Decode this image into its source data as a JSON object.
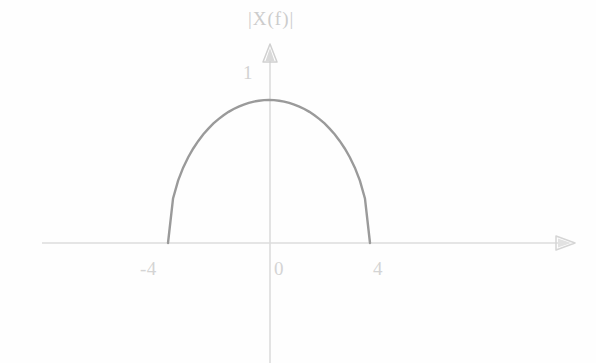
{
  "figure": {
    "background_color": "#fefefe",
    "width": 596,
    "height": 363
  },
  "axes": {
    "color": "#d8d8d8",
    "x_axis": {
      "name": "horizontal-frequency-axis",
      "y_pixel": 243,
      "x_start_pixel": 42,
      "x_end_pixel": 575,
      "arrow": "right"
    },
    "y_axis": {
      "name": "vertical-magnitude-axis",
      "x_pixel": 270,
      "y_top_pixel": 48,
      "y_bottom_pixel": 363,
      "arrow": "up"
    }
  },
  "labels": {
    "y_axis_title": "|X(f)|",
    "y_tick_1": "1",
    "x_tick_neg4": "-4",
    "x_tick_0": "0",
    "x_tick_4": "4"
  },
  "curve": {
    "name": "semi-ellipse-spectrum-curve",
    "color": "#9a9a9a",
    "stroke_width": 2.4,
    "shape": "semi-ellipse",
    "left_endpoint_px": [
      168,
      243
    ],
    "right_endpoint_px": [
      370,
      243
    ],
    "apex_px": [
      270,
      100
    ]
  },
  "chart_data": {
    "type": "line",
    "title": "",
    "subtitle": "",
    "xlabel": "f",
    "ylabel": "|X(f)|",
    "xlim": [
      -6.5,
      12.2
    ],
    "ylim": [
      0,
      1.35
    ],
    "grid": false,
    "legend": null,
    "axis_tick_labels": {
      "x": [
        "-4",
        "0",
        "4"
      ],
      "y": [
        "1"
      ]
    },
    "x_tick_values": [
      -4,
      0,
      4
    ],
    "y_tick_values": [
      1
    ],
    "annotations": [
      {
        "text": "|X(f)|",
        "position": "above y-axis arrow",
        "x": 0,
        "y": 1.33
      },
      {
        "text": "1",
        "position": "left of y-axis",
        "x": -0.9,
        "y": 1.15
      }
    ],
    "series": [
      {
        "name": "|X(f)|",
        "color": "#9a9a9a",
        "x": [
          -4,
          -3.8,
          -3.6,
          -3.4,
          -3.2,
          -3,
          -2.8,
          -2.6,
          -2.4,
          -2.2,
          -2,
          -1.8,
          -1.6,
          -1.4,
          -1.2,
          -1,
          -0.8,
          -0.6,
          -0.4,
          -0.2,
          0,
          0.2,
          0.4,
          0.6,
          0.8,
          1,
          1.2,
          1.4,
          1.6,
          1.8,
          2,
          2.2,
          2.4,
          2.6,
          2.8,
          3,
          3.2,
          3.4,
          3.6,
          3.8,
          4
        ],
        "y": [
          0,
          0.312,
          0.436,
          0.527,
          0.6,
          0.661,
          0.714,
          0.76,
          0.8,
          0.836,
          0.866,
          0.893,
          0.917,
          0.937,
          0.954,
          0.968,
          0.98,
          0.989,
          0.995,
          0.999,
          1,
          0.999,
          0.995,
          0.989,
          0.98,
          0.968,
          0.954,
          0.937,
          0.917,
          0.893,
          0.866,
          0.836,
          0.8,
          0.76,
          0.714,
          0.661,
          0.6,
          0.527,
          0.436,
          0.312,
          0
        ]
      }
    ]
  }
}
